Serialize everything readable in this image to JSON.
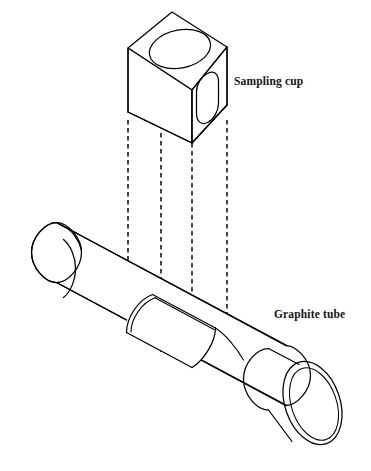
{
  "figure": {
    "background_color": "#ffffff",
    "line_color": "#000000",
    "width": 371,
    "height": 471
  },
  "labels": {
    "sampling_cup": "Sampling cup",
    "graphite_tube": "Graphite tube"
  },
  "components": {
    "sampling_cup": {
      "name": "Sampling cup",
      "shape": "cube",
      "features": [
        "circular-opening-top",
        "rounded-slot-side"
      ]
    },
    "graphite_tube": {
      "name": "Graphite tube",
      "shape": "cylinder",
      "features": [
        "left-end-collar",
        "right-end-open-ring",
        "central-cutaway-aperture"
      ]
    },
    "projection_lines": {
      "name": "alignment projection lines",
      "count": 4,
      "style": "dashed",
      "x_positions": [
        128,
        161,
        192,
        227
      ]
    }
  }
}
